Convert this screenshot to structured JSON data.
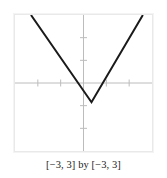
{
  "figure": {
    "caption": "[−3, 3] by [−3, 3]",
    "frame_color": "#e9e9e9",
    "axis_color": "#b9b9b9",
    "curve_color": "#1a1a1a",
    "background": "#ffffff"
  },
  "chart_data": {
    "type": "line",
    "title": "",
    "subtitle": "",
    "xlabel": "",
    "ylabel": "",
    "xlim": [
      -3,
      3
    ],
    "ylim": [
      -3,
      3
    ],
    "grid": false,
    "legend": null,
    "legend_position": "none",
    "xticks": [
      -3,
      -2,
      -1,
      1,
      2,
      3
    ],
    "yticks": [
      -3,
      -2,
      -1,
      1,
      2,
      3
    ],
    "xtick_labels": [
      "",
      "",
      "",
      "",
      "",
      ""
    ],
    "ytick_labels": [
      "",
      "",
      "",
      "",
      "",
      ""
    ],
    "axes_drawn": [
      "x-axis",
      "y-axis"
    ],
    "annotations": [],
    "series": [
      {
        "name": "v-shaped curve",
        "description": "absolute-value style V with vertex below the x-axis",
        "vertex": [
          0.35,
          -0.85
        ],
        "x": [
          -2.3,
          0.35,
          2.6
        ],
        "y": [
          3.0,
          -0.85,
          3.0
        ],
        "left_slope": -1.45,
        "right_slope": 1.71,
        "line_width": 2,
        "color": "#1a1a1a"
      }
    ],
    "window": {
      "xmin": -3,
      "xmax": 3,
      "ymin": -3,
      "ymax": 3,
      "xscl": 1,
      "yscl": 1
    }
  }
}
